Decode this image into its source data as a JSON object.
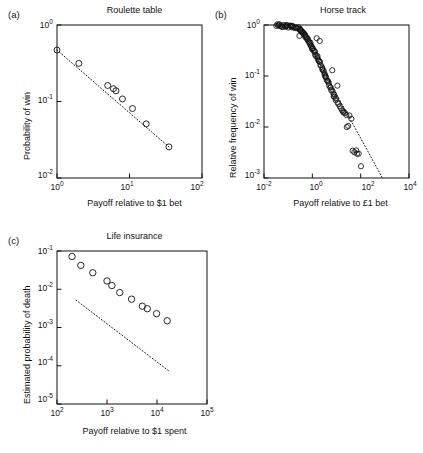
{
  "figure": {
    "background": "#ffffff",
    "ink": "#111111",
    "marker": "open-circle",
    "fit_line_style": "dotted"
  },
  "panels": [
    {
      "letter": "(a)",
      "title": "Roulette table",
      "xlabel": "Payoff relative to $1 bet",
      "ylabel": "Probability of win",
      "xticks": [
        "10",
        "10",
        "10"
      ],
      "xtick_exp": [
        "0",
        "1",
        "2"
      ],
      "yticks": [
        "10",
        "10",
        "10"
      ],
      "ytick_exp": [
        "0",
        "-1",
        "-2"
      ]
    },
    {
      "letter": "(b)",
      "title": "Horse track",
      "xlabel": "Payoff relative to £1 bet",
      "ylabel": "Relative frequency of win",
      "xticks": [
        "10",
        "10",
        "10",
        "10"
      ],
      "xtick_exp": [
        "-2",
        "0",
        "2",
        "4"
      ],
      "yticks": [
        "10",
        "10",
        "10",
        "10"
      ],
      "ytick_exp": [
        "0",
        "-1",
        "-2",
        "-3"
      ]
    },
    {
      "letter": "(c)",
      "title": "Life insurance",
      "xlabel": "Payoff relative to $1 spent",
      "ylabel": "Estimated probability of death",
      "xticks": [
        "10",
        "10",
        "10",
        "10"
      ],
      "xtick_exp": [
        "2",
        "3",
        "4",
        "5"
      ],
      "yticks": [
        "10",
        "10",
        "10",
        "10",
        "10"
      ],
      "ytick_exp": [
        "-1",
        "-2",
        "-3",
        "-4",
        "-5"
      ]
    }
  ],
  "chart_data": [
    {
      "type": "scatter",
      "panel": "a",
      "title": "Roulette table",
      "xlabel": "Payoff relative to $1 bet",
      "ylabel": "Probability of win",
      "xscale": "log",
      "yscale": "log",
      "xlim": [
        1,
        100
      ],
      "ylim": [
        0.01,
        1
      ],
      "grid": false,
      "legend": false,
      "marker": "open-circle",
      "x": [
        1.0,
        2.0,
        5.0,
        6.0,
        6.5,
        8.0,
        11.0,
        17.0,
        35.0
      ],
      "y": [
        0.47,
        0.315,
        0.162,
        0.147,
        0.138,
        0.108,
        0.081,
        0.051,
        0.0255
      ],
      "fit_line": {
        "style": "dotted",
        "x": [
          1.0,
          35.0
        ],
        "y": [
          0.47,
          0.0255
        ]
      }
    },
    {
      "type": "scatter",
      "panel": "b",
      "title": "Horse track",
      "xlabel": "Payoff relative to £1 bet",
      "ylabel": "Relative frequency of win",
      "xscale": "log",
      "yscale": "log",
      "xlim": [
        0.01,
        10000
      ],
      "ylim": [
        0.001,
        1
      ],
      "grid": false,
      "legend": false,
      "marker": "open-circle",
      "note": "dense cloud of roughly 110 points: flat plateau near y=1 for x<0.4, then steep roll-off",
      "x": [
        0.032,
        0.035,
        0.038,
        0.041,
        0.045,
        0.049,
        0.053,
        0.058,
        0.063,
        0.069,
        0.075,
        0.082,
        0.089,
        0.097,
        0.105,
        0.115,
        0.125,
        0.136,
        0.148,
        0.161,
        0.175,
        0.19,
        0.207,
        0.225,
        0.245,
        0.266,
        0.29,
        0.3,
        0.315,
        0.33,
        0.345,
        0.36,
        0.38,
        0.4,
        0.42,
        0.44,
        0.46,
        0.48,
        0.5,
        0.53,
        0.56,
        0.59,
        0.62,
        0.65,
        0.68,
        0.72,
        0.76,
        0.8,
        0.84,
        0.88,
        0.93,
        0.98,
        1.03,
        1.08,
        1.14,
        1.2,
        1.26,
        1.33,
        1.4,
        1.47,
        1.55,
        1.63,
        1.72,
        1.81,
        1.9,
        2.0,
        2.1,
        2.2,
        2.35,
        2.5,
        2.6,
        2.75,
        2.9,
        3.05,
        3.2,
        3.4,
        3.6,
        3.8,
        4.0,
        4.2,
        4.5,
        4.8,
        5.1,
        5.4,
        5.7,
        6.0,
        6.4,
        6.8,
        7.2,
        7.6,
        8.0,
        8.6,
        9.2,
        9.8,
        10.5,
        11.5,
        12.5,
        13.5,
        15.0,
        16.5,
        18.0,
        20.0,
        22.0,
        25.0,
        28.0,
        32.0,
        36.0,
        42.0,
        48.0,
        55.0,
        62.0,
        70.0,
        85.0,
        100.0
      ],
      "y": [
        0.98,
        0.98,
        0.97,
        0.98,
        0.97,
        0.98,
        0.97,
        0.96,
        0.97,
        0.96,
        0.96,
        0.95,
        0.96,
        0.95,
        0.94,
        0.95,
        0.93,
        0.94,
        0.92,
        0.93,
        0.9,
        0.91,
        0.88,
        0.89,
        0.86,
        0.87,
        0.62,
        0.84,
        0.8,
        0.82,
        0.78,
        0.76,
        0.74,
        0.72,
        0.7,
        0.68,
        0.66,
        0.64,
        0.62,
        0.6,
        0.58,
        0.56,
        0.54,
        0.52,
        0.5,
        0.48,
        0.46,
        0.44,
        0.42,
        0.4,
        0.38,
        0.36,
        0.34,
        0.33,
        0.31,
        0.3,
        0.28,
        0.27,
        0.25,
        0.55,
        0.24,
        0.22,
        0.21,
        0.2,
        0.19,
        0.18,
        0.5,
        0.17,
        0.16,
        0.15,
        0.14,
        0.13,
        0.12,
        0.115,
        0.11,
        0.1,
        0.095,
        0.09,
        0.085,
        0.08,
        0.075,
        0.07,
        0.065,
        0.062,
        0.058,
        0.055,
        0.13,
        0.05,
        0.047,
        0.044,
        0.041,
        0.038,
        0.036,
        0.034,
        0.065,
        0.031,
        0.028,
        0.026,
        0.024,
        0.022,
        0.021,
        0.02,
        0.019,
        0.018,
        0.0105,
        0.0105,
        0.016,
        0.015,
        0.0035,
        0.0032,
        0.0034,
        0.0031,
        0.0029,
        0.0017
      ],
      "fit_line": {
        "style": "dotted",
        "x": [
          1.0,
          800.0
        ],
        "y": [
          0.32,
          0.001
        ]
      }
    },
    {
      "type": "scatter",
      "panel": "c",
      "title": "Life insurance",
      "xlabel": "Payoff relative to $1 spent",
      "ylabel": "Estimated probability of death",
      "xscale": "log",
      "yscale": "log",
      "xlim": [
        100,
        100000
      ],
      "ylim": [
        1e-05,
        0.1
      ],
      "grid": false,
      "legend": false,
      "marker": "open-circle",
      "x": [
        200,
        300,
        520,
        1000,
        1250,
        1800,
        3100,
        5100,
        6400,
        9800,
        16000
      ],
      "y": [
        0.072,
        0.042,
        0.027,
        0.0165,
        0.0125,
        0.0082,
        0.0055,
        0.0036,
        0.0031,
        0.0023,
        0.0015
      ],
      "fit_line": {
        "style": "dotted",
        "x": [
          240,
          18000
        ],
        "y": [
          0.0052,
          7e-05
        ]
      }
    }
  ]
}
